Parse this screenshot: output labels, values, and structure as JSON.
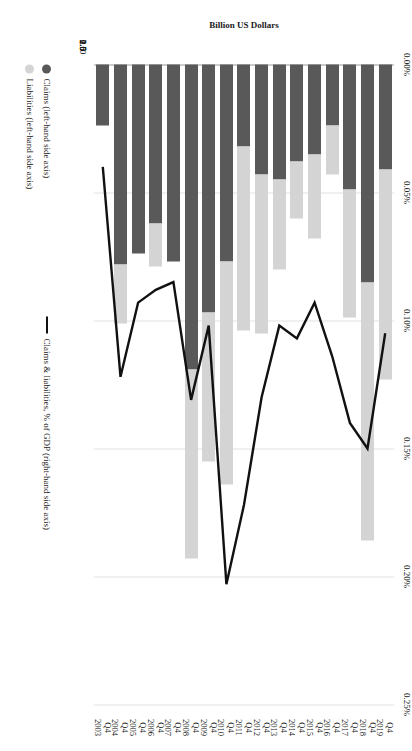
{
  "chart_data": {
    "type": "bar",
    "title": "",
    "subtitle": "",
    "orientation": "vertical-stacked-with-line-overlay",
    "xlabel": "",
    "ylabel": "Billion US Dollars",
    "y2label": "",
    "ylim": [
      0,
      2.5
    ],
    "y2lim": [
      0,
      0.25
    ],
    "grid": true,
    "legend_position": "bottom-left",
    "categories": [
      "Q4 2003",
      "Q4 2004",
      "Q4 2005",
      "Q4 2006",
      "Q4 2007",
      "Q4 2008",
      "Q4 2009",
      "Q4 2010",
      "Q4 2011",
      "Q4 2012",
      "Q4 2013",
      "Q4 2014",
      "Q4 2015",
      "Q4 2016",
      "Q4 2017",
      "Q4 2018",
      "Q4 2019"
    ],
    "category_lines": [
      {
        "q": "Q4",
        "yr": "2003"
      },
      {
        "q": "Q4",
        "yr": "2004"
      },
      {
        "q": "Q4",
        "yr": "2005"
      },
      {
        "q": "Q4",
        "yr": "2006"
      },
      {
        "q": "Q4",
        "yr": "2007"
      },
      {
        "q": "Q4",
        "yr": "2008"
      },
      {
        "q": "Q4",
        "yr": "2009"
      },
      {
        "q": "Q4",
        "yr": "2010"
      },
      {
        "q": "Q4",
        "yr": "2011"
      },
      {
        "q": "Q4",
        "yr": "2012"
      },
      {
        "q": "Q4",
        "yr": "2013"
      },
      {
        "q": "Q4",
        "yr": "2014"
      },
      {
        "q": "Q4",
        "yr": "2015"
      },
      {
        "q": "Q4",
        "yr": "2016"
      },
      {
        "q": "Q4",
        "yr": "2017"
      },
      {
        "q": "Q4",
        "yr": "2018"
      },
      {
        "q": "Q4",
        "yr": "2019"
      }
    ],
    "series": [
      {
        "name": "Claims (left-hand side axis)",
        "axis": "left",
        "kind": "bar",
        "color": "#595959",
        "values": [
          0.24,
          0.78,
          0.74,
          0.62,
          0.77,
          1.19,
          0.97,
          0.77,
          0.32,
          0.43,
          0.45,
          0.38,
          0.35,
          0.24,
          0.49,
          0.85,
          0.41
        ]
      },
      {
        "name": "Liabilities (left-hand side axis)",
        "axis": "left",
        "kind": "bar",
        "color": "#d4d4d4",
        "values": [
          0.0,
          0.23,
          0.0,
          0.17,
          0.0,
          0.74,
          0.58,
          0.87,
          0.72,
          0.62,
          0.35,
          0.22,
          0.33,
          0.19,
          0.5,
          1.01,
          0.82
        ]
      },
      {
        "name": "Claims & liabilities, % of GDP (right-hand side axis)",
        "axis": "right",
        "kind": "line",
        "color": "#111111",
        "values": [
          0.04,
          0.122,
          0.093,
          0.088,
          0.085,
          0.131,
          0.102,
          0.203,
          0.172,
          0.13,
          0.102,
          0.107,
          0.093,
          0.114,
          0.14,
          0.15,
          0.105
        ]
      }
    ],
    "y_ticks": [
      "0",
      "0.5",
      "1.0",
      "1.5",
      "2.0",
      "2.5"
    ],
    "y_tick_values": [
      0,
      0.5,
      1.0,
      1.5,
      2.0,
      2.5
    ],
    "y2_ticks": [
      "0.00%",
      "0.05%",
      "0.10%",
      "0.15%",
      "0.20%",
      "0.25%"
    ],
    "y2_tick_values": [
      0,
      0.05,
      0.1,
      0.15,
      0.2,
      0.25
    ]
  },
  "legend": {
    "claims_label": "Claims (left-hand side axis)",
    "liabilities_label": "Liabilities (left-hand side axis)",
    "line_label": "Claims & liabilities, % of GDP (right-hand side axis)"
  },
  "axes": {
    "left_title": "Billion US Dollars"
  },
  "colors": {
    "claims": "#595959",
    "liabilities": "#d4d4d4",
    "line": "#111111",
    "grid": "#e2e2e2",
    "axis": "#9a9a9a"
  }
}
